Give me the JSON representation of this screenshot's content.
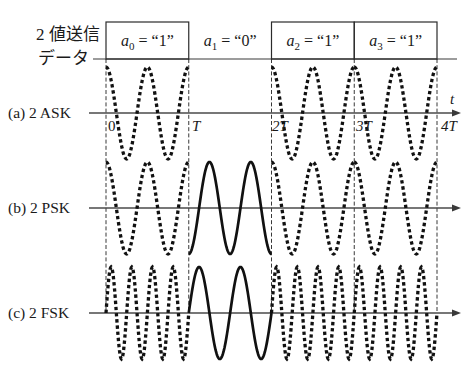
{
  "figure": {
    "header": {
      "line1": "2 値送信",
      "line2": "データ"
    },
    "bits": [
      {
        "symbol": "a",
        "index": "0",
        "eq": " = “1”",
        "value": 1,
        "boxed": true
      },
      {
        "symbol": "a",
        "index": "1",
        "eq": " = “0”",
        "value": 0,
        "boxed": false
      },
      {
        "symbol": "a",
        "index": "2",
        "eq": " = “1”",
        "value": 1,
        "boxed": true
      },
      {
        "symbol": "a",
        "index": "3",
        "eq": " = “1”",
        "value": 1,
        "boxed": true
      }
    ],
    "rows": [
      {
        "label": "(a) 2 ASK",
        "scheme": "ASK"
      },
      {
        "label": "(b) 2 PSK",
        "scheme": "PSK"
      },
      {
        "label": "(c) 2 FSK",
        "scheme": "FSK"
      }
    ],
    "axis": {
      "t_label": "t",
      "ticks": [
        "0",
        "T",
        "2T",
        "3T",
        "4T"
      ]
    }
  },
  "waveforms": {
    "bit_sequence": [
      1,
      0,
      1,
      1
    ],
    "symbol_period": "T",
    "ASK": {
      "bit_1": {
        "waveform": "cos",
        "cycles_per_T": 2,
        "amplitude": 1,
        "style": "dotted"
      },
      "bit_0": {
        "waveform": "none",
        "cycles_per_T": 0,
        "amplitude": 0,
        "style": "none"
      }
    },
    "PSK": {
      "bit_1": {
        "waveform": "cos",
        "cycles_per_T": 2,
        "amplitude": 1,
        "style": "dotted"
      },
      "bit_0": {
        "waveform": "-cos",
        "cycles_per_T": 2,
        "amplitude": 1,
        "style": "solid"
      }
    },
    "FSK": {
      "bit_1": {
        "waveform": "sin",
        "cycles_per_T": 4,
        "amplitude": 1,
        "style": "dotted"
      },
      "bit_0": {
        "waveform": "sin",
        "cycles_per_T": 2,
        "amplitude": 1,
        "style": "solid"
      }
    }
  }
}
